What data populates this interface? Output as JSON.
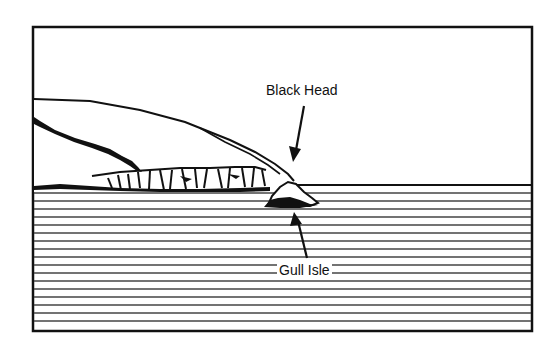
{
  "diagram": {
    "type": "coastal illustration",
    "labels": {
      "black_head": "Black Head",
      "gull_isle": "Gull Isle"
    },
    "colors": {
      "ink": "#111111",
      "water_lines": "#444444",
      "background": "#ffffff"
    },
    "features": [
      {
        "name": "Black Head",
        "kind": "headland",
        "pointer": "arrow pointing down to tip of headland"
      },
      {
        "name": "Gull Isle",
        "kind": "islet",
        "pointer": "arrow pointing up to islet at base of headland"
      }
    ],
    "sea": {
      "style": "horizontal hatch lines",
      "line_count": 17
    }
  }
}
